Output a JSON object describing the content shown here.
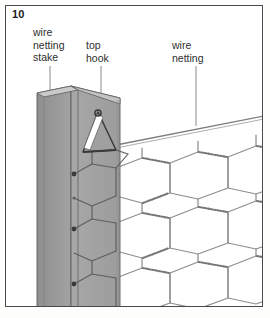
{
  "figure": {
    "step_number": "10",
    "frame_color": "#4a4a4a",
    "background_color": "#ffffff"
  },
  "labels": {
    "stake": "wire\nnetting\nstake",
    "hook": "top\nhook",
    "netting": "wire\nnetting"
  },
  "diagram": {
    "stake": {
      "type": "angle-iron-post",
      "face_left_color": "#9a9a9a",
      "face_right_color": "#a6a6a6",
      "top_face_color": "#c6c6c6",
      "edge_color": "#5a5a5a"
    },
    "hook": {
      "type": "triangular-top-hook",
      "highlight_color": "#ffffff",
      "outline_color": "#3d3d3d"
    },
    "netting": {
      "pattern": "hexagonal",
      "wire_color": "#8c8c8c",
      "twist_color": "#6e6e6e"
    },
    "attachment_nodes": 4
  }
}
